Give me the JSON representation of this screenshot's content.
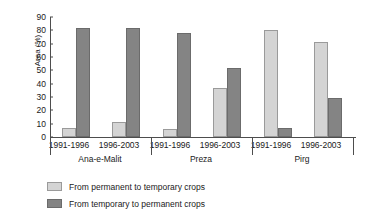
{
  "chart_data": {
    "type": "bar",
    "title": "",
    "xlabel": "",
    "ylabel": "Area (%)",
    "ylim": [
      0,
      90
    ],
    "ytick_values": [
      0,
      10,
      20,
      30,
      40,
      50,
      60,
      70,
      80,
      90
    ],
    "ytick_labels": [
      "0",
      "10",
      "20",
      "30",
      "40",
      "50",
      "60",
      "70",
      "80",
      "90"
    ],
    "grid": false,
    "legend_position": "below",
    "groups": [
      {
        "name": "Ana-e-Malit",
        "periods": [
          {
            "label": "1991-1996",
            "from_permanent_to_temporary": 7,
            "from_temporary_to_permanent": 82
          },
          {
            "label": "1996-2003",
            "from_permanent_to_temporary": 11,
            "from_temporary_to_permanent": 82
          }
        ]
      },
      {
        "name": "Preza",
        "periods": [
          {
            "label": "1991-1996",
            "from_permanent_to_temporary": 6,
            "from_temporary_to_permanent": 78
          },
          {
            "label": "1996-2003",
            "from_permanent_to_temporary": 37,
            "from_temporary_to_permanent": 52
          }
        ]
      },
      {
        "name": "Pirg",
        "periods": [
          {
            "label": "1991-1996",
            "from_permanent_to_temporary": 80,
            "from_temporary_to_permanent": 7
          },
          {
            "label": "1996-2003",
            "from_permanent_to_temporary": 71,
            "from_temporary_to_permanent": 29
          }
        ]
      }
    ],
    "series": [
      {
        "name": "From permanent to temporary crops",
        "color": "#d4d4d4",
        "values": [
          7,
          11,
          6,
          37,
          80,
          71
        ]
      },
      {
        "name": "From temporary to permanent crops",
        "color": "#848484",
        "values": [
          82,
          82,
          78,
          52,
          7,
          29
        ]
      }
    ],
    "categories": [
      "Ana-e-Malit 1991-1996",
      "Ana-e-Malit 1996-2003",
      "Preza 1991-1996",
      "Preza 1996-2003",
      "Pirg 1991-1996",
      "Pirg 1996-2003"
    ]
  },
  "legend": {
    "items": [
      {
        "label": "From permanent to temporary crops",
        "swatch": "light"
      },
      {
        "label": "From temporary to permanent crops",
        "swatch": "dark"
      }
    ]
  }
}
